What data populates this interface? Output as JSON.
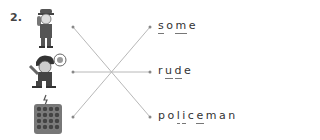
{
  "exercise": {
    "number": "2.",
    "pictures": [
      {
        "name": "policeman-picture",
        "description": "police officer saluting"
      },
      {
        "name": "rude-boy-picture",
        "description": "angry boy shouting"
      },
      {
        "name": "some-items-picture",
        "description": "group of many small items"
      }
    ],
    "words": [
      {
        "text": "some",
        "underlined_letters": [
          0,
          2
        ]
      },
      {
        "text": "rude",
        "underlined_letters": [
          1,
          2
        ]
      },
      {
        "text": "policeman",
        "underlined_letters": [
          2,
          3,
          5
        ]
      }
    ],
    "matches": [
      {
        "from": 0,
        "to": 2
      },
      {
        "from": 1,
        "to": 1
      },
      {
        "from": 2,
        "to": 0
      }
    ],
    "line_color": "#b8b8b8"
  }
}
